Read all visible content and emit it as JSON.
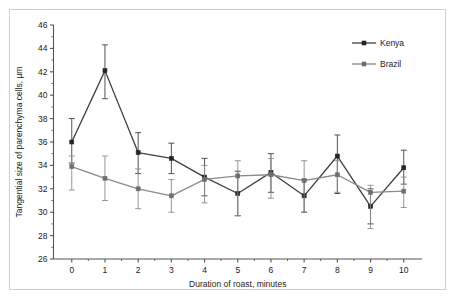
{
  "chart_data": {
    "type": "line",
    "title": "",
    "subtitle": "",
    "xlabel": "Duration of roast, minutes",
    "ylabel": "Tangential size of parenchyma cells, µm",
    "xlim": [
      -0.55,
      10.55
    ],
    "ylim": [
      26,
      46
    ],
    "xticks": [
      "0",
      "1",
      "2",
      "3",
      "4",
      "5",
      "6",
      "7",
      "8",
      "9",
      "10"
    ],
    "yticks": [
      "26",
      "28",
      "30",
      "32",
      "34",
      "36",
      "38",
      "40",
      "42",
      "44",
      "46"
    ],
    "y_minor_tick_step": 1,
    "grid": false,
    "legend_position": "top-right",
    "marker": "square",
    "error_bars": "vertical",
    "x": [
      0,
      1,
      2,
      3,
      4,
      5,
      6,
      7,
      8,
      9,
      10
    ],
    "series": [
      {
        "name": "Kenya",
        "color": "#3f3f3f",
        "marker_color": "#262626",
        "values": [
          36.0,
          42.1,
          35.1,
          34.6,
          33.0,
          31.6,
          33.4,
          31.4,
          34.8,
          30.5,
          33.8
        ],
        "err_low": [
          34.2,
          39.7,
          33.3,
          33.3,
          31.4,
          29.7,
          31.7,
          30.0,
          31.6,
          29.0,
          32.4
        ],
        "err_high": [
          38.0,
          44.3,
          36.8,
          35.9,
          34.6,
          33.5,
          35.0,
          32.8,
          36.6,
          32.0,
          35.3
        ]
      },
      {
        "name": "Brazil",
        "color": "#8a8a8a",
        "marker_color": "#6e6e6e",
        "values": [
          33.9,
          32.9,
          32.0,
          31.4,
          32.8,
          33.1,
          33.2,
          32.7,
          33.2,
          31.7,
          31.8
        ],
        "err_low": [
          31.9,
          31.0,
          30.3,
          30.0,
          30.8,
          29.7,
          31.2,
          30.0,
          31.7,
          28.6,
          30.4
        ],
        "err_high": [
          34.8,
          34.8,
          33.7,
          32.8,
          34.0,
          34.4,
          34.6,
          34.4,
          34.4,
          32.3,
          33.0
        ]
      }
    ]
  },
  "legend": {
    "items": [
      {
        "label": "Kenya"
      },
      {
        "label": "Brazil"
      }
    ]
  },
  "axes": {
    "x_title": "Duration of roast, minutes",
    "y_title": "Tangential size of parenchyma cells, µm"
  },
  "colors": {
    "kenya": "#3f3f3f",
    "brazil": "#8a8a8a",
    "axis": "#555555",
    "frame": "#cfcfcf",
    "background": "#ffffff"
  }
}
